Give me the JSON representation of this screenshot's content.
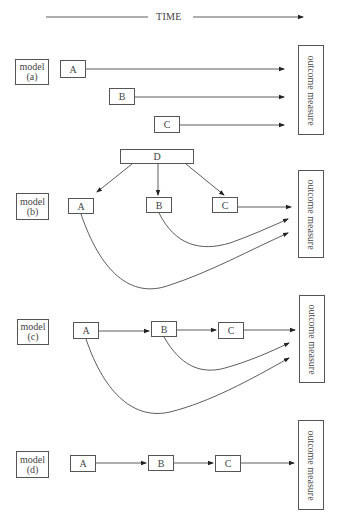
{
  "header": {
    "time_label": "TIME"
  },
  "models": [
    {
      "id": "a",
      "label_line1": "model",
      "label_line2": "(a)",
      "nodes": [
        "A",
        "B",
        "C"
      ],
      "outcome": "outcome measure"
    },
    {
      "id": "b",
      "label_line1": "model",
      "label_line2": "(b)",
      "nodes": [
        "D",
        "A",
        "B",
        "C"
      ],
      "outcome": "outcome measure"
    },
    {
      "id": "c",
      "label_line1": "model",
      "label_line2": "(c)",
      "nodes": [
        "A",
        "B",
        "C"
      ],
      "outcome": "outcome measure"
    },
    {
      "id": "d",
      "label_line1": "model",
      "label_line2": "(d)",
      "nodes": [
        "A",
        "B",
        "C"
      ],
      "outcome": "outcome measure"
    }
  ],
  "colors": {
    "line": "#333333",
    "border": "#555555",
    "text": "#444444"
  }
}
